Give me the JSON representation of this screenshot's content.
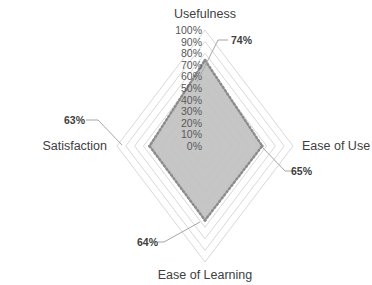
{
  "chart_data": {
    "type": "radar",
    "title": "",
    "categories": [
      "Usefulness",
      "Ease of Use",
      "Ease of Learning",
      "Satisfaction"
    ],
    "series": [
      {
        "name": "Score",
        "values": [
          74,
          65,
          64,
          63
        ],
        "labels": [
          "74%",
          "65%",
          "64%",
          "63%"
        ]
      }
    ],
    "rlim": [
      0,
      100
    ],
    "ticks": [
      "0%",
      "10%",
      "20%",
      "30%",
      "40%",
      "50%",
      "60%",
      "70%",
      "80%",
      "90%",
      "100%"
    ],
    "tick_values": [
      0,
      10,
      20,
      30,
      40,
      50,
      60,
      70,
      80,
      90,
      100
    ],
    "grid": true,
    "legend": "none",
    "colors": {
      "fill": "#c0c0c0",
      "border": "#8c8c8c",
      "grid": "#d9d9d9",
      "leader": "#a6a6a6"
    }
  }
}
